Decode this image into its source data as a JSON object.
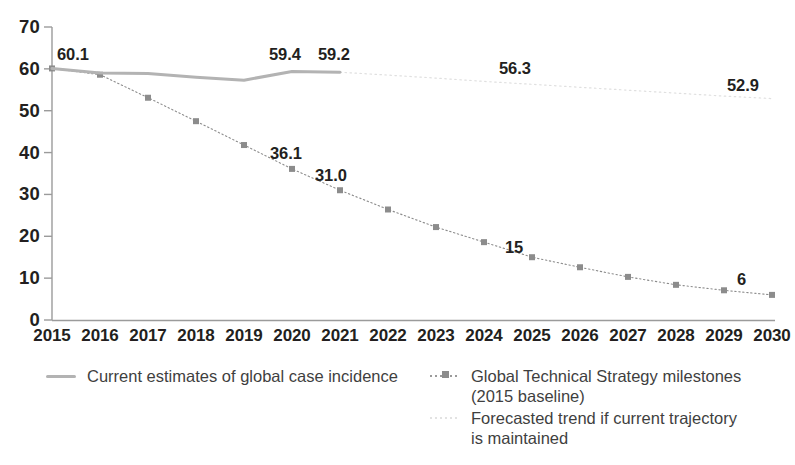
{
  "chart_data": {
    "type": "line",
    "title": "",
    "xlabel": "",
    "ylabel": "",
    "grid": false,
    "legend_position": "bottom",
    "categories": [
      "2015",
      "2016",
      "2017",
      "2018",
      "2019",
      "2020",
      "2021",
      "2022",
      "2023",
      "2024",
      "2025",
      "2026",
      "2027",
      "2028",
      "2029",
      "2030"
    ],
    "x": [
      2015,
      2016,
      2017,
      2018,
      2019,
      2020,
      2021,
      2022,
      2023,
      2024,
      2025,
      2026,
      2027,
      2028,
      2029,
      2030
    ],
    "ylim": [
      0,
      70
    ],
    "xlim": [
      2015,
      2030
    ],
    "yticks": [
      "70",
      "60",
      "50",
      "40",
      "30",
      "20",
      "10",
      "0"
    ],
    "ytick_values": [
      70,
      60,
      50,
      40,
      30,
      20,
      10,
      0
    ],
    "series": [
      {
        "name": "Current estimates of global case incidence",
        "style": "solid",
        "color": "#b3b3b3",
        "x": [
          2015,
          2016,
          2017,
          2018,
          2019,
          2020,
          2021
        ],
        "values": [
          60.1,
          59.0,
          58.9,
          58.0,
          57.3,
          59.4,
          59.2
        ],
        "point_labels": [
          {
            "x": 2015,
            "value": "60.1"
          },
          {
            "x": 2020,
            "value": "59.4"
          },
          {
            "x": 2021,
            "value": "59.2"
          }
        ]
      },
      {
        "name": "Global Technical Strategy milestones (2015 baseline)",
        "style": "dotted-with-square-markers",
        "color": "#8c8c8c",
        "x": [
          2015,
          2016,
          2017,
          2018,
          2019,
          2020,
          2021,
          2022,
          2023,
          2024,
          2025,
          2026,
          2027,
          2028,
          2029,
          2030
        ],
        "values": [
          60.1,
          58.6,
          53.1,
          47.5,
          41.8,
          36.1,
          31.0,
          26.4,
          22.2,
          18.6,
          15.0,
          12.6,
          10.3,
          8.4,
          7.1,
          6.0
        ],
        "point_labels": [
          {
            "x": 2020,
            "value": "36.1"
          },
          {
            "x": 2021,
            "value": "31.0"
          },
          {
            "x": 2025,
            "value": "15"
          },
          {
            "x": 2030,
            "value": "6"
          }
        ]
      },
      {
        "name": "Forecasted trend if current trajectory is maintained",
        "style": "faint-dotted",
        "color": "#e0e0e0",
        "x": [
          2021,
          2022,
          2023,
          2024,
          2025,
          2026,
          2027,
          2028,
          2029,
          2030
        ],
        "values": [
          59.2,
          58.5,
          57.8,
          57.0,
          56.3,
          55.6,
          54.9,
          54.2,
          53.5,
          52.9
        ],
        "point_labels": [
          {
            "x": 2025,
            "value": "56.3"
          },
          {
            "x": 2030,
            "value": "52.9"
          }
        ]
      }
    ]
  },
  "axis": {
    "y_labels": [
      "70",
      "60",
      "50",
      "40",
      "30",
      "20",
      "10",
      "0"
    ],
    "x_labels": [
      "2015",
      "2016",
      "2017",
      "2018",
      "2019",
      "2020",
      "2021",
      "2022",
      "2023",
      "2024",
      "2025",
      "2026",
      "2027",
      "2028",
      "2029",
      "2030"
    ]
  },
  "value_labels": [
    {
      "name": "label-60-1",
      "text": "60.1",
      "left": 57,
      "top": 46
    },
    {
      "name": "label-59-4",
      "text": "59.4",
      "left": 269,
      "top": 46
    },
    {
      "name": "label-59-2",
      "text": "59.2",
      "left": 318,
      "top": 46
    },
    {
      "name": "label-56-3",
      "text": "56.3",
      "left": 499,
      "top": 60
    },
    {
      "name": "label-52-9",
      "text": "52.9",
      "left": 727,
      "top": 77
    },
    {
      "name": "label-36-1",
      "text": "36.1",
      "left": 270,
      "top": 145
    },
    {
      "name": "label-31-0",
      "text": "31.0",
      "left": 315,
      "top": 167
    },
    {
      "name": "label-15",
      "text": "15",
      "left": 505,
      "top": 239
    },
    {
      "name": "label-6",
      "text": "6",
      "left": 737,
      "top": 271
    }
  ],
  "legend": {
    "items": [
      {
        "id": "current",
        "key": "solid-line-key-icon",
        "label": "Current estimates of global case incidence"
      },
      {
        "id": "gts",
        "key": "dotted-line-square-marker-key-icon",
        "label": "Global Technical Strategy milestones\n(2015 baseline)"
      },
      {
        "id": "forecast",
        "key": "faint-dotted-line-key-icon",
        "label": "Forecasted trend if current trajectory\nis maintained"
      }
    ]
  },
  "colors": {
    "axis": "#9b9b9b",
    "text": "#231f20",
    "legend_text": "#3f3f3f",
    "series_current": "#b3b3b3",
    "series_gts": "#8c8c8c",
    "series_forecast": "#e0e0e0"
  }
}
